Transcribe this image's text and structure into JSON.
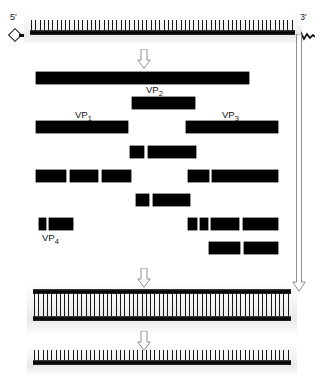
{
  "diagram": {
    "labels": {
      "five_prime": "5′",
      "three_prime": "3′",
      "vp1": "VP",
      "vp1_sub": "1",
      "vp2": "VP",
      "vp2_sub": "2",
      "vp3": "VP",
      "vp3_sub": "3",
      "vp4": "VP",
      "vp4_sub": "4"
    },
    "colors": {
      "backbone": "#000000",
      "bar": "#000000",
      "arrow_stroke": "#8f8f8f",
      "arrow_fill": "#ffffff",
      "text": "#141414",
      "background": "#ffffff"
    },
    "strands": [
      {
        "id": "genomic-rna-plus",
        "name": "genomic-plus-strand-rna",
        "x": 30,
        "y": 20,
        "width": 265,
        "height": 18,
        "tick_count": 62,
        "tick_side": "up",
        "double": false,
        "has_vpg": true,
        "has_polya": true
      },
      {
        "id": "replicative-form-dsrna",
        "name": "double-stranded-replicative-form",
        "x": 33,
        "y": 289,
        "width": 258,
        "height": 38,
        "tick_count": 60,
        "tick_side": "both",
        "double": true,
        "has_vpg": false,
        "has_polya": false
      },
      {
        "id": "progeny-rna-plus",
        "name": "progeny-plus-strand-rna",
        "x": 33,
        "y": 350,
        "width": 258,
        "height": 18,
        "tick_count": 60,
        "tick_side": "up",
        "double": false,
        "has_vpg": false,
        "has_polya": false
      }
    ],
    "product_rows": [
      {
        "name": "polyprotein-precursor-row",
        "y": 72,
        "height": 12,
        "bars": [
          {
            "x": 36,
            "w": 213
          }
        ]
      },
      {
        "name": "vp2-precursor-row",
        "y": 97,
        "height": 12,
        "bars": [
          {
            "x": 132,
            "w": 63
          }
        ]
      },
      {
        "name": "vp1-vp3-row",
        "y": 121,
        "height": 12,
        "bars": [
          {
            "x": 36,
            "w": 92
          },
          {
            "x": 186,
            "w": 92
          }
        ]
      },
      {
        "name": "cleavage-row-1",
        "y": 146,
        "height": 12,
        "bars": [
          {
            "x": 130,
            "w": 14
          },
          {
            "x": 148,
            "w": 48
          }
        ]
      },
      {
        "name": "cleavage-row-2",
        "y": 170,
        "height": 12,
        "bars": [
          {
            "x": 36,
            "w": 30
          },
          {
            "x": 70,
            "w": 28
          },
          {
            "x": 102,
            "w": 29
          },
          {
            "x": 188,
            "w": 21
          },
          {
            "x": 212,
            "w": 66
          }
        ]
      },
      {
        "name": "cleavage-row-3",
        "y": 194,
        "height": 12,
        "bars": [
          {
            "x": 136,
            "w": 13
          },
          {
            "x": 153,
            "w": 37
          }
        ]
      },
      {
        "name": "vp4-row",
        "y": 218,
        "height": 12,
        "bars": [
          {
            "x": 39,
            "w": 7
          },
          {
            "x": 49,
            "w": 24
          },
          {
            "x": 188,
            "w": 9
          },
          {
            "x": 200,
            "w": 8
          },
          {
            "x": 211,
            "w": 28
          },
          {
            "x": 243,
            "w": 35
          }
        ]
      },
      {
        "name": "cleavage-row-4",
        "y": 242,
        "height": 12,
        "bars": [
          {
            "x": 209,
            "w": 31
          },
          {
            "x": 244,
            "w": 34
          }
        ]
      }
    ],
    "arrows": [
      {
        "name": "translation-arrow",
        "x": 137,
        "y": 49,
        "w": 14,
        "h": 20,
        "type": "short"
      },
      {
        "name": "replication-arrow",
        "x": 137,
        "y": 268,
        "w": 14,
        "h": 20,
        "type": "short"
      },
      {
        "name": "strand-release-arrow",
        "x": 137,
        "y": 331,
        "w": 14,
        "h": 20,
        "type": "short"
      },
      {
        "name": "template-transfer-arrow",
        "x": 292,
        "y": 34,
        "w": 14,
        "h": 258,
        "type": "long"
      }
    ],
    "label_positions": {
      "five_prime": {
        "x": 10,
        "y": 12
      },
      "three_prime": {
        "x": 300,
        "y": 12
      },
      "vp2": {
        "x": 146,
        "y": 84
      },
      "vp1": {
        "x": 75,
        "y": 109
      },
      "vp3": {
        "x": 222,
        "y": 109
      },
      "vp4": {
        "x": 42,
        "y": 232
      }
    }
  }
}
